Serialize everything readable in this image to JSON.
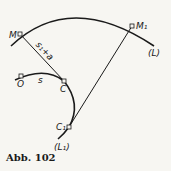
{
  "figure": {
    "caption": "Abb. 102",
    "colors": {
      "ink": "#1a1a1a",
      "paper": "#f7f6f2"
    },
    "curves": [
      {
        "id": "L",
        "label": "(L)"
      },
      {
        "id": "L1",
        "label": "(L₁)"
      }
    ],
    "points": [
      {
        "id": "M",
        "label": "M"
      },
      {
        "id": "M1",
        "label": "M₁"
      },
      {
        "id": "O",
        "label": "O"
      },
      {
        "id": "C",
        "label": "C"
      },
      {
        "id": "C1",
        "label": "C₁"
      }
    ],
    "segment_labels": {
      "MC": "s₁+a",
      "OC": "s"
    }
  }
}
